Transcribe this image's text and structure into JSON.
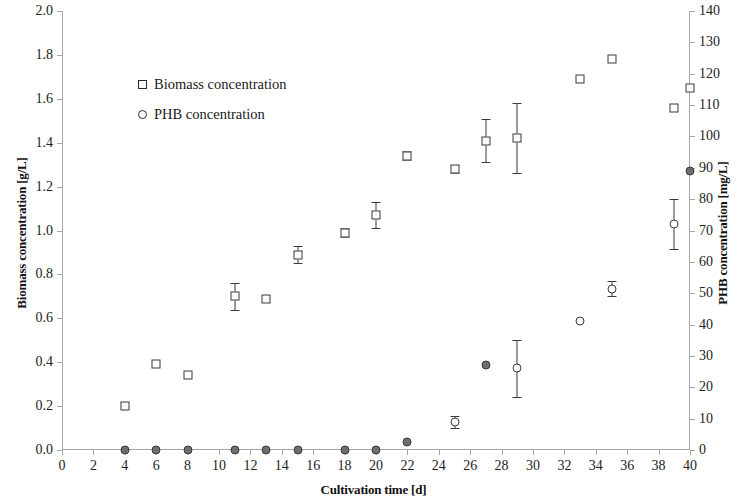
{
  "chart_data": {
    "type": "scatter",
    "title": "",
    "xlabel": "Cultivation time [d]",
    "ylabel": "Biomass concentration [g/L]",
    "y2label": "PHB concentration [mg/L]",
    "xlim": [
      0,
      40
    ],
    "ylim": [
      0.0,
      2.0
    ],
    "y2lim": [
      0,
      140
    ],
    "grid": false,
    "legend_position": "upper-left-inside",
    "x_ticks": [
      0,
      2,
      4,
      6,
      8,
      10,
      12,
      14,
      16,
      18,
      20,
      22,
      24,
      26,
      28,
      30,
      32,
      34,
      36,
      38,
      40
    ],
    "x_tick_labels": [
      "0",
      "2",
      "4",
      "6",
      "8",
      "10",
      "12",
      "14",
      "16",
      "18",
      "20",
      "22",
      "24",
      "26",
      "28",
      "30",
      "32",
      "34",
      "36",
      "38",
      "40"
    ],
    "y_ticks": [
      0.0,
      0.2,
      0.4,
      0.6,
      0.8,
      1.0,
      1.2,
      1.4,
      1.6,
      1.8,
      2.0
    ],
    "y_tick_labels": [
      "0.0",
      "0.2",
      "0.4",
      "0.6",
      "0.8",
      "1.0",
      "1.2",
      "1.4",
      "1.6",
      "1.8",
      "2.0"
    ],
    "y2_ticks": [
      0,
      10,
      20,
      30,
      40,
      50,
      60,
      70,
      80,
      90,
      100,
      110,
      120,
      130,
      140
    ],
    "y2_tick_labels": [
      "0",
      "10",
      "20",
      "30",
      "40",
      "50",
      "60",
      "70",
      "80",
      "90",
      "100",
      "110",
      "120",
      "130",
      "140"
    ],
    "series": [
      {
        "name": "Biomass concentration",
        "marker": "square",
        "axis": "left",
        "x": [
          4,
          6,
          8,
          11,
          13,
          15,
          18,
          20,
          22,
          25,
          27,
          29,
          33,
          35,
          39,
          40
        ],
        "y": [
          0.2,
          0.39,
          0.34,
          0.7,
          0.69,
          0.89,
          0.99,
          1.07,
          1.34,
          1.28,
          1.41,
          1.42,
          1.69,
          1.78,
          1.56,
          1.65
        ],
        "yerr": [
          0.0,
          0.0,
          0.0,
          0.06,
          0.0,
          0.04,
          0.02,
          0.06,
          0.02,
          0.02,
          0.1,
          0.16,
          0.0,
          0.0,
          0.0,
          0.0
        ]
      },
      {
        "name": "PHB concentration",
        "marker": "circle",
        "axis": "right",
        "x": [
          4,
          6,
          8,
          11,
          13,
          15,
          18,
          20,
          22,
          25,
          27,
          29,
          33,
          35,
          39,
          40
        ],
        "y": [
          0,
          0,
          0,
          0,
          0,
          0,
          0,
          0,
          2.5,
          9.0,
          27.0,
          26.0,
          41.0,
          51.5,
          72.0,
          89.0
        ],
        "yerr": [
          0,
          0,
          0,
          0,
          0,
          0,
          0,
          0,
          0,
          2.0,
          0,
          9.0,
          0,
          2.5,
          8.0,
          0
        ],
        "filled": [
          true,
          true,
          true,
          true,
          true,
          true,
          true,
          true,
          true,
          false,
          true,
          false,
          false,
          false,
          false,
          true
        ]
      }
    ]
  },
  "legend": {
    "items": [
      {
        "label": "Biomass concentration",
        "marker": "square"
      },
      {
        "label": "PHB concentration",
        "marker": "circle"
      }
    ]
  }
}
